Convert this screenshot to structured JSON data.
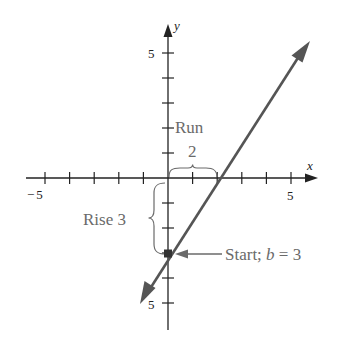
{
  "figure": {
    "colors": {
      "axis": "#222222",
      "line": "#555555",
      "annotation": "#6a6a6a",
      "background": "#ffffff"
    },
    "axes": {
      "x_label": "x",
      "y_label": "y",
      "x_range": [
        -5,
        5
      ],
      "y_range": [
        -5,
        5
      ],
      "x_tick_labels": [
        "-5",
        "5"
      ],
      "y_tick_labels": [
        "5",
        "-5"
      ],
      "x_ticks": [
        -5,
        -4,
        -3,
        -2,
        -1,
        1,
        2,
        3,
        4,
        5
      ],
      "y_ticks": [
        -5,
        -4,
        -3,
        -2,
        -1,
        1,
        2,
        3,
        4,
        5
      ]
    },
    "line": {
      "description": "y = (3/2)x - 3",
      "slope": "3/2",
      "intercept": -3,
      "passes_through": [
        [
          0,
          -3
        ],
        [
          2,
          0
        ]
      ]
    },
    "annotations": {
      "run_label": "Run",
      "run_value": "2",
      "rise_label": "Rise 3",
      "start_prefix": "Start; ",
      "start_var": "b",
      "start_suffix": " = 3"
    }
  }
}
